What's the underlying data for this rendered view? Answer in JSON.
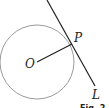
{
  "diagram": {
    "type": "geometry",
    "colors": {
      "circle": "#9a9a9a",
      "lines": "#222222",
      "text": "#222222"
    },
    "labels": {
      "center": "O",
      "point": "P",
      "line": "L"
    },
    "caption": "Fig. 2.1",
    "circle": {
      "cx": 37,
      "cy": 62,
      "r": 37
    },
    "point_p": {
      "x": 72,
      "y": 44
    },
    "tangent": {
      "x1": 47,
      "y1": 0,
      "x2": 95,
      "y2": 86
    }
  }
}
